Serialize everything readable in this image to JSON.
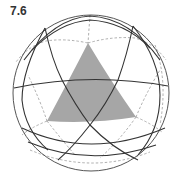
{
  "figure": {
    "label": "7.6"
  },
  "colors": {
    "background": "#ffffff",
    "outline": "#555555",
    "great_circle": "#333333",
    "dashed": "#999999",
    "shade": "#a6a6a6",
    "label": "#333333"
  },
  "sphere": {
    "cx": 91,
    "cy": 93,
    "r": 78
  },
  "shaded_triangle": {
    "vertices": [
      [
        88,
        43
      ],
      [
        47,
        121
      ],
      [
        136,
        117
      ]
    ]
  },
  "inner_triangle": {
    "vertices": [
      [
        62,
        80
      ],
      [
        118,
        80
      ],
      [
        90,
        125
      ]
    ]
  }
}
